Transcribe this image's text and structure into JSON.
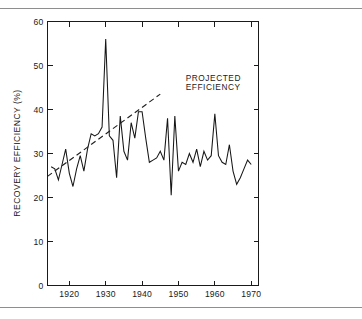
{
  "figure": {
    "background_color": "#ffffff",
    "line_color": "#161616",
    "rule_color": "#8e8e8e",
    "top_rule_name": "top-separator-rule",
    "bottom_rule_name": "bottom-separator-rule"
  },
  "chart_data": {
    "type": "line",
    "title": "",
    "xlabel": "",
    "ylabel": "RECOVERY EFFICIENCY (%)",
    "xlim": [
      1914,
      1972
    ],
    "ylim": [
      0,
      60
    ],
    "grid": false,
    "legend_position": "none",
    "x_ticks": [
      1920,
      1930,
      1940,
      1950,
      1960,
      1970
    ],
    "x_tick_labels": [
      "1920",
      "1930",
      "1940",
      "1950",
      "1960",
      "1970"
    ],
    "y_ticks": [
      0,
      10,
      20,
      30,
      40,
      50,
      60
    ],
    "y_tick_labels": [
      "0",
      "10",
      "20",
      "30",
      "40",
      "50",
      "60"
    ],
    "annotations": [
      {
        "name": "projected-efficiency-label",
        "lines": [
          "PROJECTED",
          "EFFICIENCY"
        ],
        "x": 1952,
        "y": 46.5
      }
    ],
    "series": [
      {
        "name": "Recovery efficiency",
        "style": "solid",
        "x": [
          1915,
          1916,
          1917,
          1918,
          1919,
          1920,
          1921,
          1922,
          1923,
          1924,
          1925,
          1926,
          1927,
          1928,
          1929,
          1930,
          1931,
          1932,
          1933,
          1934,
          1935,
          1936,
          1937,
          1938,
          1939,
          1940,
          1941,
          1942,
          1943,
          1944,
          1945,
          1946,
          1947,
          1948,
          1949,
          1950,
          1951,
          1952,
          1953,
          1954,
          1955,
          1956,
          1957,
          1958,
          1959,
          1960,
          1961,
          1962,
          1963,
          1964,
          1965,
          1966,
          1967,
          1968,
          1969,
          1970
        ],
        "values": [
          27.0,
          26.5,
          24.0,
          27.5,
          31.0,
          25.5,
          22.5,
          26.5,
          29.5,
          26.0,
          31.0,
          34.5,
          34.0,
          34.5,
          36.0,
          56.0,
          34.0,
          33.0,
          24.5,
          38.5,
          30.5,
          28.5,
          37.0,
          33.5,
          39.5,
          39.5,
          33.5,
          28.0,
          28.5,
          29.0,
          30.5,
          28.5,
          38.0,
          20.5,
          38.5,
          26.0,
          28.0,
          27.5,
          30.0,
          28.0,
          31.0,
          27.0,
          30.5,
          28.5,
          29.5,
          39.0,
          29.5,
          28.0,
          27.5,
          32.0,
          26.0,
          23.0,
          24.5,
          26.5,
          28.5,
          27.5
        ]
      },
      {
        "name": "Projected efficiency",
        "style": "dashed",
        "x": [
          1914,
          1945
        ],
        "values": [
          24.8,
          43.5
        ]
      }
    ]
  }
}
